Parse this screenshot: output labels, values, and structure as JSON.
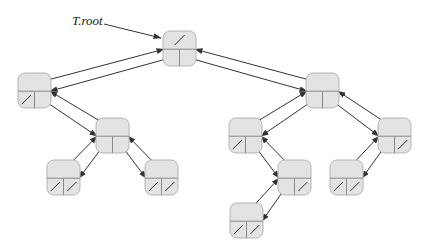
{
  "diagram": {
    "type": "binary-search-tree-linked-representation",
    "root_label": "T.root",
    "colors": {
      "node_fill": "#e3e3e3",
      "node_stroke": "#b4b4b4",
      "divider": "#8a8a8a",
      "arrow": "#333333",
      "nil_slash": "#333333"
    },
    "node_size": {
      "w": 33,
      "h": 35
    },
    "nodes": [
      {
        "id": "root",
        "x": 163,
        "y": 31,
        "parent": null,
        "left": "L",
        "right": "R"
      },
      {
        "id": "L",
        "x": 18,
        "y": 73,
        "parent": "root",
        "left": null,
        "right": "LR"
      },
      {
        "id": "LR",
        "x": 96,
        "y": 118,
        "parent": "L",
        "left": "LRL",
        "right": "LRR"
      },
      {
        "id": "LRL",
        "x": 47,
        "y": 160,
        "parent": "LR",
        "left": null,
        "right": null
      },
      {
        "id": "LRR",
        "x": 145,
        "y": 160,
        "parent": "LR",
        "left": null,
        "right": null
      },
      {
        "id": "R",
        "x": 306,
        "y": 73,
        "parent": "root",
        "left": "RL",
        "right": "RR"
      },
      {
        "id": "RL",
        "x": 229,
        "y": 118,
        "parent": "R",
        "left": null,
        "right": "RLR"
      },
      {
        "id": "RR",
        "x": 378,
        "y": 118,
        "parent": "R",
        "left": "RRL",
        "right": null
      },
      {
        "id": "RLR",
        "x": 278,
        "y": 160,
        "parent": "RL",
        "left": "RLRL",
        "right": null
      },
      {
        "id": "RRL",
        "x": 330,
        "y": 160,
        "parent": "RR",
        "left": null,
        "right": null
      },
      {
        "id": "RLRL",
        "x": 230,
        "y": 203,
        "parent": "RLR",
        "left": null,
        "right": null
      }
    ],
    "root_pointer": {
      "label_x": 72,
      "label_y": 25,
      "from": [
        104,
        24
      ],
      "to": [
        161,
        38
      ]
    }
  }
}
